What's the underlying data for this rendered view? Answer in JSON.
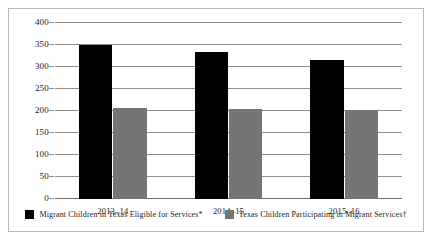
{
  "chart_data": {
    "type": "bar",
    "title": "",
    "subtitle": "",
    "xlabel": "",
    "ylabel": "",
    "categories": [
      "2013–14",
      "2014–15",
      "2015–16"
    ],
    "series": [
      {
        "name": "Migrant Children in Texas Eligible for Services*",
        "color": "#000000",
        "values": [
          350,
          333,
          317
        ]
      },
      {
        "name": "Texas Children Participating in Migrant Services†",
        "color": "#757575",
        "values": [
          207,
          205,
          202
        ]
      }
    ],
    "ylim": [
      0,
      400
    ],
    "ytick_step": 50,
    "yticks": [
      0,
      50,
      100,
      150,
      200,
      250,
      300,
      350,
      400
    ],
    "ytick_labels": [
      "0",
      "50",
      "100",
      "150",
      "200",
      "250",
      "300",
      "350",
      "400"
    ],
    "grid": true,
    "grid_axis": "y",
    "legend_position": "bottom-center",
    "annotations": []
  },
  "legend": {
    "items": [
      {
        "label": "Migrant Children in Texas Eligible for Services*",
        "color": "#000000"
      },
      {
        "label": "Texas Children Participating in Migrant Services†",
        "color": "#757575"
      }
    ]
  },
  "colors": {
    "series_black": "#000000",
    "series_gray": "#757575",
    "gridline": "#8e8e8e",
    "frame_border": "#b9b9b9",
    "text": "#1a1a1a",
    "background": "#ffffff"
  }
}
